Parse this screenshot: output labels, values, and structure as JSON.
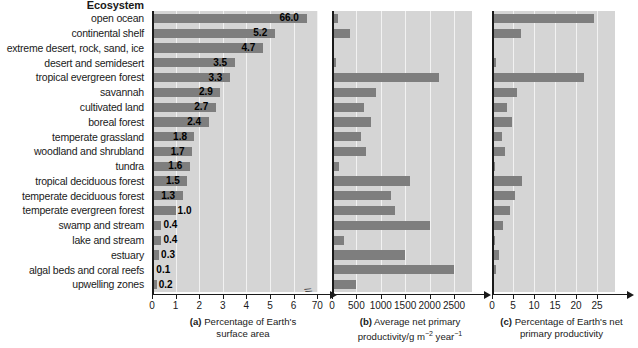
{
  "column_header": "Ecosystem",
  "ecosystems": [
    "open ocean",
    "continental shelf",
    "extreme desert, rock, sand, ice",
    "desert and semidesert",
    "tropical evergreen forest",
    "savannah",
    "cultivated land",
    "boreal forest",
    "temperate grassland",
    "woodland and shrubland",
    "tundra",
    "tropical deciduous forest",
    "temperate deciduous forest",
    "temperate evergreen forest",
    "swamp and stream",
    "lake and stream",
    "estuary",
    "algal beds and coral reefs",
    "upwelling zones"
  ],
  "panel_a": {
    "caption_tag": "(a)",
    "caption_line1": "Percentage of Earth's",
    "caption_line2": "surface area",
    "tick_labels": [
      "0",
      "1",
      "2",
      "3",
      "4",
      "5",
      "6",
      "70"
    ],
    "tick_values": [
      0,
      1,
      2,
      3,
      4,
      5,
      6,
      7
    ],
    "has_axis_break": true,
    "value_labels": [
      "66.0",
      "5.2",
      "4.7",
      "3.5",
      "3.3",
      "2.9",
      "2.7",
      "2.4",
      "1.8",
      "1.7",
      "1.6",
      "1.5",
      "1.3",
      "1.0",
      "0.4",
      "0.4",
      "0.3",
      "0.1",
      "0.2"
    ],
    "bar_draw_values": [
      6.55,
      5.2,
      4.7,
      3.5,
      3.3,
      2.9,
      2.7,
      2.4,
      1.8,
      1.7,
      1.6,
      1.5,
      1.3,
      1.0,
      0.4,
      0.4,
      0.3,
      0.1,
      0.2
    ]
  },
  "panel_b": {
    "caption_tag": "(b)",
    "caption_line1": "Average net primary",
    "caption_line2": "productivity/g m",
    "caption_sup1": "−2",
    "caption_mid": " year",
    "caption_sup2": "−1",
    "tick_labels": [
      "0",
      "500",
      "1000",
      "1500",
      "2000",
      "2500"
    ],
    "tick_values": [
      0,
      500,
      1000,
      1500,
      2000,
      2500
    ],
    "values": [
      125,
      360,
      3,
      90,
      2200,
      900,
      650,
      800,
      600,
      700,
      140,
      1600,
      1200,
      1300,
      2000,
      250,
      1500,
      2500,
      500
    ]
  },
  "panel_c": {
    "caption_tag": "(c)",
    "caption_line1": "Percentage of Earth's net",
    "caption_line2": "primary productivity",
    "tick_labels": [
      "0",
      "5",
      "10",
      "15",
      "20",
      "25"
    ],
    "tick_values": [
      0,
      5,
      10,
      15,
      20,
      25
    ],
    "values": [
      24.4,
      6.9,
      0.04,
      0.9,
      22.0,
      6.0,
      3.5,
      4.8,
      2.4,
      3.2,
      0.6,
      7.1,
      5.4,
      4.4,
      2.6,
      0.6,
      1.6,
      1.0,
      0.1
    ]
  },
  "colors": {
    "bar": "#7e7e7e",
    "plot_background": "#d5d5d5",
    "gridline": "#f2f2f2",
    "axis": "#1a1a1a",
    "text": "#1a1a1a"
  }
}
